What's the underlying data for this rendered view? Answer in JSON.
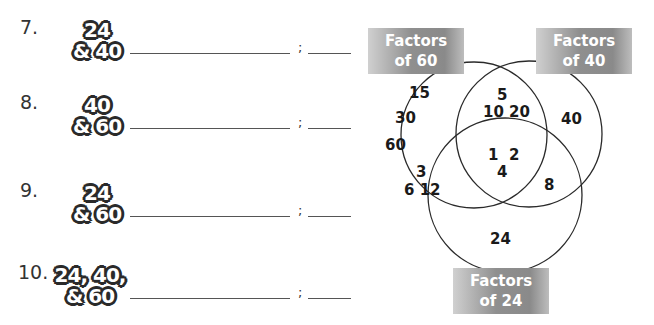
{
  "exercises": [
    {
      "number": "7.",
      "pair_line1": "24",
      "pair_line2": "& 40",
      "separator": ";"
    },
    {
      "number": "8.",
      "pair_line1": "40",
      "pair_line2": "& 60",
      "separator": ";"
    },
    {
      "number": "9.",
      "pair_line1": "24",
      "pair_line2": "& 60",
      "separator": ";"
    },
    {
      "number": "10.",
      "pair_line1": "24, 40,",
      "pair_line2": "& 60",
      "separator": ";"
    }
  ],
  "venn": {
    "labels": {
      "sixty": {
        "line1": "Factors",
        "line2": "of 60"
      },
      "forty": {
        "line1": "Factors",
        "line2": "of 40"
      },
      "twentyfour": {
        "line1": "Factors",
        "line2": "of 24"
      }
    },
    "regions": {
      "only_60": [
        "15",
        "30",
        "60"
      ],
      "60_and_40": [
        "5",
        "10 20"
      ],
      "only_40": [
        "40"
      ],
      "all_three": [
        "1  2",
        "4"
      ],
      "60_and_24": [
        "3",
        "6 12"
      ],
      "40_and_24": [
        "8"
      ],
      "only_24": [
        "24"
      ]
    },
    "colors": {
      "label_bg": "#8a8a8a",
      "label_text": "#ffffff",
      "circle_stroke": "#2a2a2a"
    }
  }
}
